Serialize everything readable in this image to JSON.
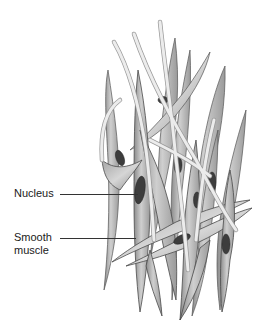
{
  "figure": {
    "style": "grayscale",
    "colors": {
      "background": "#ffffff",
      "cell_fill": "#bdbdbd",
      "cell_shade": "#8a8a8a",
      "cell_outline": "#4a4a4a",
      "nucleus": "#3d3d3d",
      "nerve_fiber": "#e6e6e6"
    }
  },
  "labels": [
    {
      "id": "nucleus",
      "text": "Nucleus"
    },
    {
      "id": "smooth-muscle",
      "line1": "Smooth",
      "line2": "muscle"
    }
  ]
}
